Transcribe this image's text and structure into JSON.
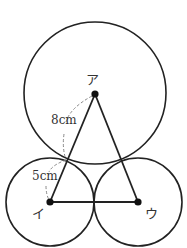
{
  "diagram": {
    "type": "geometry-circles",
    "colors": {
      "stroke": "#222222",
      "dashed": "#888888",
      "background": "#ffffff",
      "text": "#333333"
    },
    "points": {
      "A": {
        "label": "ア",
        "x": 95,
        "y": 94
      },
      "I": {
        "label": "イ",
        "x": 50,
        "y": 202
      },
      "U": {
        "label": "ウ",
        "x": 138,
        "y": 202
      }
    },
    "circles": [
      {
        "name": "large-circle",
        "center": "A",
        "cx": 95,
        "cy": 93,
        "r": 71
      },
      {
        "name": "left-small-circle",
        "center": "I",
        "cx": 50,
        "cy": 202,
        "r": 44
      },
      {
        "name": "right-small-circle",
        "center": "U",
        "cx": 138,
        "cy": 202,
        "r": 44
      }
    ],
    "segments": [
      {
        "from": "A",
        "to": "I"
      },
      {
        "from": "A",
        "to": "U"
      },
      {
        "from": "I",
        "to": "U"
      }
    ],
    "measurements": [
      {
        "label": "8cm",
        "description": "radius of large circle (ア to tangent point)"
      },
      {
        "label": "5cm",
        "description": "radius of small circle (tangent point to イ)"
      }
    ]
  }
}
